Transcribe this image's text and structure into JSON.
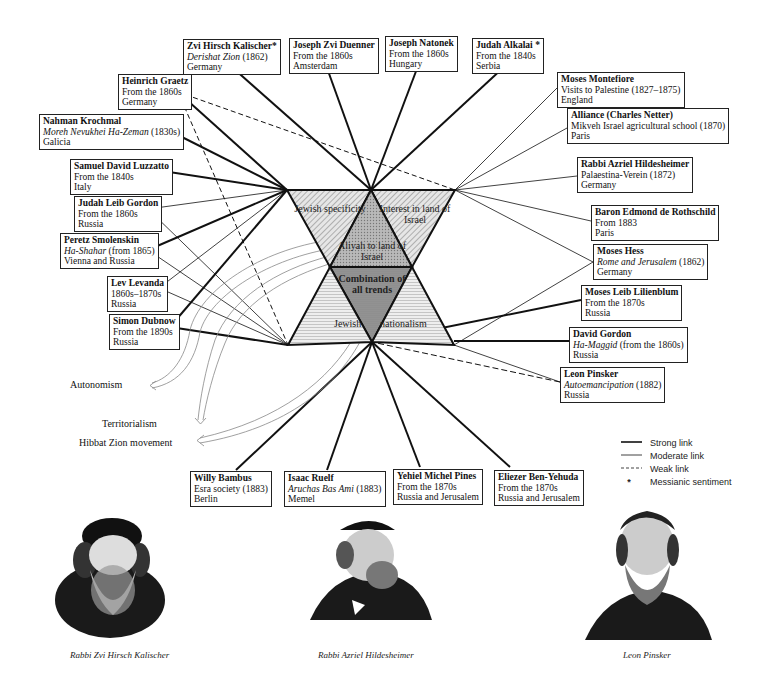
{
  "center": {
    "triangles": {
      "jewish_specificity": "Jewish specificity",
      "interest_land": "Interest in land of Israel",
      "aliyah": "Aliyah to land of Israel",
      "combination": "Combination of all trends",
      "jewish_nationalism_left": "Jewish",
      "jewish_nationalism_right": "nationalism"
    }
  },
  "people": [
    {
      "id": "kalischer",
      "name": "Zvi Hirsch Kalischer*",
      "line2_italic": "Derishat Zion",
      "line2_rest": " (1862)",
      "line3": "Germany"
    },
    {
      "id": "duenner",
      "name": "Joseph Zvi Duenner",
      "line2": "From the 1860s",
      "line3": "Amsterdam"
    },
    {
      "id": "natonek",
      "name": "Joseph Natonek",
      "line2": "From the 1860s",
      "line3": "Hungary"
    },
    {
      "id": "alkalai",
      "name": "Judah Alkalai *",
      "line2": "From the 1840s",
      "line3": "Serbia"
    },
    {
      "id": "graetz",
      "name": "Heinrich Graetz",
      "line2": "From the 1860s",
      "line3": "Germany"
    },
    {
      "id": "krochmal",
      "name": "Nahman Krochmal",
      "line2_italic": "Moreh Nevukhei Ha-Zeman",
      "line2_rest": " (1830s)",
      "line3": "Galicia"
    },
    {
      "id": "luzzatto",
      "name": "Samuel David Luzzatto",
      "line2": "From the 1840s",
      "line3": "Italy"
    },
    {
      "id": "gordon_jl",
      "name": "Judah Leib Gordon",
      "line2": "From the 1860s",
      "line3": "Russia"
    },
    {
      "id": "smolenskin",
      "name": "Peretz Smolenskin",
      "line2_italic": "Ha-Shahar",
      "line2_rest": " (from 1865)",
      "line3": "Vienna and Russia"
    },
    {
      "id": "levanda",
      "name": "Lev Levanda",
      "line2": "1860s–1870s",
      "line3": "Russia"
    },
    {
      "id": "dubnow",
      "name": "Simon Dubnow",
      "line2": "From the 1890s",
      "line3": "Russia"
    },
    {
      "id": "montefiore",
      "name": "Moses Montefiore",
      "line2": "Visits to Palestine (1827–1875)",
      "line3": "England"
    },
    {
      "id": "alliance",
      "name": "Alliance (Charles Netter)",
      "line2": "Mikveh Israel agricultural school (1870)",
      "line3": "Paris"
    },
    {
      "id": "hildesheimer",
      "name": "Rabbi Azriel Hildesheimer",
      "line2": "Palaestina-Verein (1872)",
      "line3": "Germany"
    },
    {
      "id": "rothschild",
      "name": "Baron Edmond de Rothschild",
      "line2": "From 1883",
      "line3": "Paris"
    },
    {
      "id": "hess",
      "name": "Moses Hess",
      "line2_italic": "Rome and Jerusalem",
      "line2_rest": " (1862)",
      "line3": "Germany"
    },
    {
      "id": "lilienblum",
      "name": "Moses Leib Lilienblum",
      "line2": "From the 1870s",
      "line3": "Russia"
    },
    {
      "id": "gordon_d",
      "name": "David Gordon",
      "line2_italic": "Ha-Maggid",
      "line2_rest": " (from the 1860s)",
      "line3": "Russia"
    },
    {
      "id": "pinsker",
      "name": "Leon Pinsker",
      "line2_italic": "Autoemancipation",
      "line2_rest": " (1882)",
      "line3": "Russia"
    },
    {
      "id": "bambus",
      "name": "Willy Bambus",
      "line2": "Esra society (1883)",
      "line3": "Berlin"
    },
    {
      "id": "ruelf",
      "name": "Isaac Ruelf",
      "line2_italic": "Aruchas Bas Ami",
      "line2_rest": " (1883)",
      "line3": "Memel"
    },
    {
      "id": "pines",
      "name": "Yehiel Michel Pines",
      "line2": "From the 1870s",
      "line3": "Russia and Jerusalem"
    },
    {
      "id": "benyehuda",
      "name": "Eliezer Ben-Yehuda",
      "line2": "From the 1870s",
      "line3": "Russia and Jerusalem"
    }
  ],
  "outcomes": {
    "autonomism": "Autonomism",
    "territorialism": "Territorialism",
    "hibbat_zion": "Hibbat Zion movement"
  },
  "legend": {
    "strong": "Strong link",
    "moderate": "Moderate link",
    "weak": "Weak link",
    "messianic": "Messianic sentiment",
    "messianic_symbol": "*"
  },
  "captions": {
    "kalischer": "Rabbi Zvi Hirsch Kalischer",
    "hildesheimer": "Rabbi Azriel Hildesheimer",
    "pinsker": "Leon Pinsker"
  }
}
